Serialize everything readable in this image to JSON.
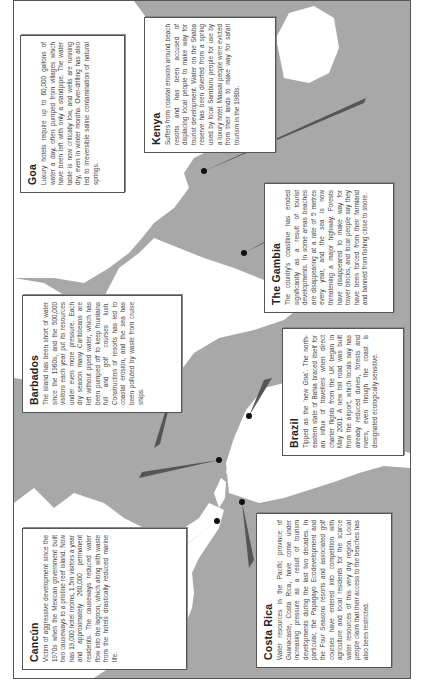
{
  "figure": {
    "caption": "Tourism and water: impacts in coastal destinations",
    "background_color": "#a8a8a8",
    "land_color": "#ffffff",
    "pointer_color": "#555555"
  },
  "callouts": [
    {
      "id": "cancun",
      "title": "Cancún",
      "text": "Victim of aggressive development since the 1970s when the Mexican government built two causeways to a pristine reef island. Now has 19,000 hotel rooms, 1.5m visitors a year and approximately 260,000 permanent residents. The causeways reduced water flow into the lagoon, which along with waste from the hotels drastically reduced marine life."
    },
    {
      "id": "costa-rica",
      "title": "Costa Rica",
      "text": "Water resources in the Pacific province of Guanacaste, Costa Rica, have come under increasing pressure as a result of tourism developments during the last two decades. In particular, the Papagayo Ecodevelopment and the Four Seasons resorts and associated golf courses have entered into competition with agriculture and local residents for the scarce water resources of this very dry region. Local people claim that their access to the beaches has also been restricted."
    },
    {
      "id": "barbados",
      "title": "Barbados",
      "text": "The island has been short of water since the 1960s, and the 500,000 visitors each year put its resources under even more pressure. Each dry season many Caribbeans are left without piped water, which has been pumped off to keep fountains full and golf courses lush. Construction of resorts has led to coastal erosion, and the sea has been polluted by waste from cruise ships."
    },
    {
      "id": "brazil",
      "title": "Brazil",
      "text": "Tipped as the 'new Goa'. The north-eastern state of Bahia braced itself for an influx of travellers when direct charter flights from the UK began in May 2001. A new toll road was built from the airport, which locals say has already reduced dunes, forests and rivers, even though the coast is designated ecologically sensitive."
    },
    {
      "id": "goa",
      "title": "Goa",
      "text": "Luxury hotels require up to 60,000 gallons of water a day, often pumped from villages which have been left with only a standpipe. The water table is now critically low, and wells are running dry, even in winter months. Over-drilling has also led to irreversible saline contamination of natural springs."
    },
    {
      "id": "kenya",
      "title": "Kenya",
      "text": "Suffers from coastal erosion around beach resorts and has been accused of displacing local people to make way for tourist development. Water on the Shaba reserve has been diverted from a spring used by local Samburu people for use by a luxury hotel. Maasai people were evicted from their lands to make way for safari tourism in the 1980s."
    },
    {
      "id": "the-gambia",
      "title": "The Gambia",
      "text": "The country's coastline has eroded significantly as a result of tourist developments. In some areas beaches are disappearing at a rate of 5 metres every year, and the sea is now threatening a major highway. Forests have disappeared to make way for tower blocks, and local people say they have been forced from their farmland and banned from fishing close to shore."
    }
  ]
}
